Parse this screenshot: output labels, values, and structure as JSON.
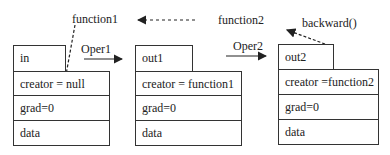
{
  "labels": {
    "function1": "function1",
    "function2": "function2",
    "oper1": "Oper1",
    "oper2": "Oper2",
    "backward": "backward()"
  },
  "tensors": [
    {
      "name": "in",
      "creator": "creator = null",
      "grad": "grad=0",
      "data": "data"
    },
    {
      "name": "out1",
      "creator": "creator = function1",
      "grad": "grad=0",
      "data": "data"
    },
    {
      "name": "out2",
      "creator": "creator =function2",
      "grad": "grad=0",
      "data": "data"
    }
  ]
}
